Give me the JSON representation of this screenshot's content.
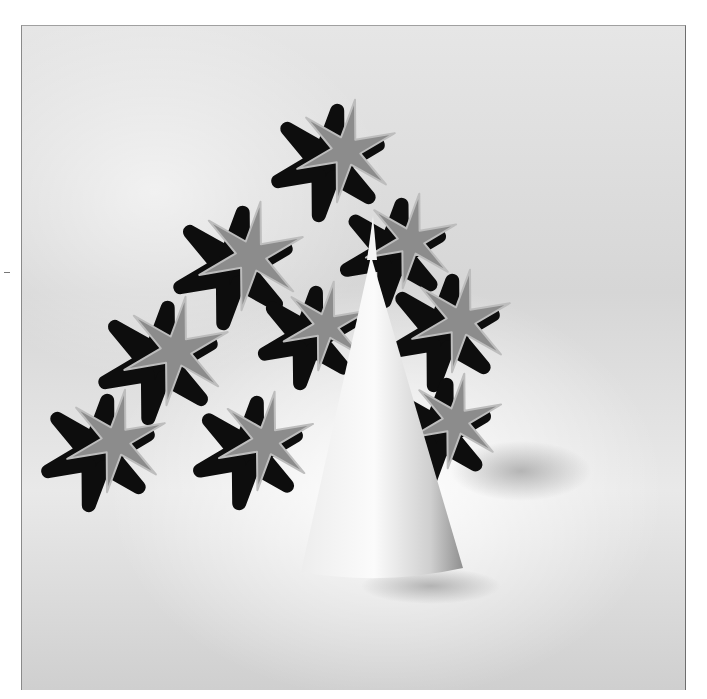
{
  "image": {
    "description": "Halftone black-and-white photograph of interlocking six-armed star-shaped modules stacked into a triangular lattice, with a white cone standing in front",
    "palette": {
      "background": "#ffffff",
      "paper_gray": "#d9d9d9",
      "module_face": "#8c8c8c",
      "module_shadow": "#0d0d0d",
      "cone": "#f4f4f4",
      "cone_shade": "#9a9a9a"
    }
  },
  "scene": {
    "stars": [
      {
        "cx": 345,
        "cy": 150,
        "r": 52
      },
      {
        "cx": 250,
        "cy": 255,
        "r": 55
      },
      {
        "cx": 410,
        "cy": 240,
        "r": 48
      },
      {
        "cx": 175,
        "cy": 350,
        "r": 55
      },
      {
        "cx": 460,
        "cy": 320,
        "r": 52
      },
      {
        "cx": 325,
        "cy": 325,
        "r": 45
      },
      {
        "cx": 115,
        "cy": 440,
        "r": 52
      },
      {
        "cx": 265,
        "cy": 440,
        "r": 50
      },
      {
        "cx": 455,
        "cy": 420,
        "r": 48
      }
    ],
    "cone": {
      "apex_x": 370,
      "apex_y": 255,
      "base_left": 300,
      "base_right": 462,
      "base_y": 575
    }
  }
}
